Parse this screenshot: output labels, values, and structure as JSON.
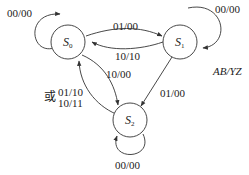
{
  "diagram": {
    "type": "state-transition",
    "legend": "AB/YZ",
    "states": [
      {
        "id": "S0",
        "name": "S",
        "sub": "0"
      },
      {
        "id": "S1",
        "name": "S",
        "sub": "1"
      },
      {
        "id": "S2",
        "name": "S",
        "sub": "2"
      }
    ],
    "transitions": [
      {
        "from": "S0",
        "to": "S0",
        "label": "00/00"
      },
      {
        "from": "S1",
        "to": "S1",
        "label": "00/00"
      },
      {
        "from": "S2",
        "to": "S2",
        "label": "00/00"
      },
      {
        "from": "S0",
        "to": "S1",
        "label": "01/00"
      },
      {
        "from": "S1",
        "to": "S0",
        "label": "10/10"
      },
      {
        "from": "S0",
        "to": "S2",
        "label": "10/00"
      },
      {
        "from": "S1",
        "to": "S2",
        "label": "01/00"
      },
      {
        "from": "S2",
        "to": "S0",
        "label_prefix": "或",
        "label_line1": "01/10",
        "label_line2": "10/11"
      }
    ]
  }
}
